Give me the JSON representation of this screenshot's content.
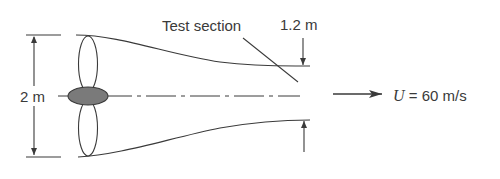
{
  "diagram": {
    "labels": {
      "inlet_diameter": "2 m",
      "test_section": "Test section",
      "test_section_diameter": "1.2 m",
      "velocity_symbol": "U",
      "velocity_value": " = 60 m/s"
    },
    "colors": {
      "line": "#3a3a3a",
      "hub_fill": "#7a7a7a",
      "background": "#ffffff"
    }
  }
}
